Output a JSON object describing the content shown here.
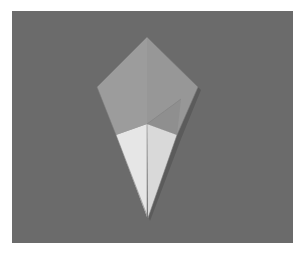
{
  "image": {
    "description": "Folded paper origami kite base on a gray background",
    "subject": "origami-kite-fold",
    "colors": {
      "border": "#ffffff",
      "background": "#6b6b6b",
      "paper_colored_side": "#9a9a9a",
      "paper_colored_side_shade": "#8e8e8e",
      "paper_white_side": "#e4e4e4",
      "paper_white_side_shade": "#d6d6d6",
      "shadow": "#4a4a4a",
      "fold_line": "#8a8a8a"
    },
    "shape_points": {
      "top": [
        147,
        37
      ],
      "left": [
        97,
        87
      ],
      "right": [
        198,
        87
      ],
      "center": [
        147,
        124
      ],
      "white_left": [
        116,
        135
      ],
      "white_right": [
        177,
        135
      ],
      "bottom": [
        148,
        218
      ]
    }
  }
}
